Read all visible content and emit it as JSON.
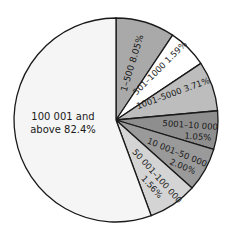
{
  "chart_data": {
    "type": "pie",
    "title": "",
    "legend": "none (labels inside slices)",
    "start_angle": "12 o'clock, clockwise",
    "categories": [
      "1–500",
      "501–1000",
      "1001–5000",
      "5001–10 000",
      "10 001–50 000",
      "50 001–100 000",
      "100 001 and above"
    ],
    "values": [
      8.05,
      1.59,
      3.71,
      1.05,
      2.0,
      1.56,
      82.4
    ],
    "unit": "%",
    "labels": [
      {
        "text": "1–500 8.05%"
      },
      {
        "text": "501–1000 1.59%"
      },
      {
        "text": "1001–5000 3.71%"
      },
      {
        "line1": "5001–10 000",
        "line2": "1.05%"
      },
      {
        "line1": "10 001–50 000",
        "line2": "2.00%"
      },
      {
        "line1": "50 001–100 000",
        "line2": "1.56%"
      },
      {
        "line1": "100 001 and",
        "line2": "above 82.4%"
      }
    ],
    "drawn_angles_deg": [
      [
        0,
        33.7
      ],
      [
        33.7,
        56.3
      ],
      [
        56.3,
        84.8
      ],
      [
        84.8,
        106.8
      ],
      [
        106.8,
        131.8
      ],
      [
        131.8,
        159.8
      ],
      [
        159.8,
        360
      ]
    ],
    "colors": [
      "#a9a9a9",
      "#ffffff",
      "#bdbdbd",
      "#8e8e8e",
      "#9a9a9a",
      "#d4d4d4",
      "#f5f5f5"
    ]
  },
  "geometry": {
    "cx": 116,
    "cy": 120,
    "r": 102
  }
}
